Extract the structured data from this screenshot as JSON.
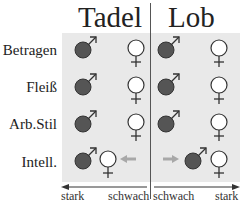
{
  "columns": [
    {
      "title": "Tadel",
      "axis_left": "stark",
      "axis_right": "schwach"
    },
    {
      "title": "Lob",
      "axis_left": "schwach",
      "axis_right": "stark"
    }
  ],
  "rows": [
    {
      "label": "Betragen"
    },
    {
      "label": "Fleiß"
    },
    {
      "label": "Arb.Stil"
    },
    {
      "label": "Intell."
    }
  ],
  "symbols": {
    "male": "male-symbol (filled dark circle with arrow)",
    "female": "female-symbol (open circle with cross)"
  },
  "colors": {
    "panel": "#e9e9e9",
    "male_fill": "#555555",
    "female_fill": "#ffffff",
    "stroke": "#333333",
    "shift_arrow": "#a8a8a8"
  }
}
